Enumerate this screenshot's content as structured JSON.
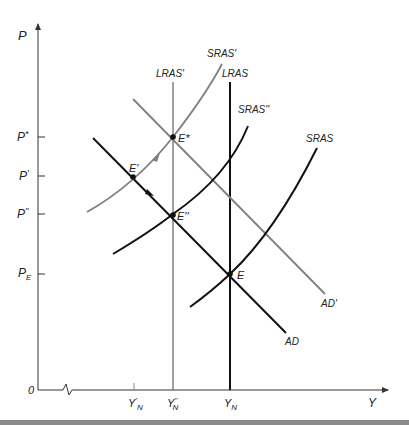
{
  "diagram": {
    "type": "AD-AS macroeconomic model",
    "axes": {
      "y_label": "P",
      "x_label": "Y",
      "origin_label": "0",
      "y_ticks": [
        {
          "label": "P*",
          "y": 137
        },
        {
          "label": "P'",
          "y": 176
        },
        {
          "label": "P''",
          "y": 214
        },
        {
          "label": "P_E",
          "y": 274
        }
      ],
      "x_ticks": [
        {
          "label": "Y'_N",
          "x": 134
        },
        {
          "label": "Y''_N",
          "x": 173
        },
        {
          "label": "Y_N",
          "x": 230
        }
      ]
    },
    "curves": {
      "lras_prime": {
        "label": "LRAS'",
        "color": "#808080"
      },
      "lras": {
        "label": "LRAS",
        "color": "#111111"
      },
      "sras_prime": {
        "label": "SRAS'",
        "color": "#808080"
      },
      "sras_double_prime": {
        "label": "SRAS''",
        "color": "#111111"
      },
      "sras": {
        "label": "SRAS",
        "color": "#111111"
      },
      "ad_prime": {
        "label": "AD'",
        "color": "#808080"
      },
      "ad": {
        "label": "AD",
        "color": "#111111"
      }
    },
    "points": {
      "e_star": {
        "label": "E*"
      },
      "e_prime": {
        "label": "E'"
      },
      "e_double_prime": {
        "label": "E''"
      },
      "e": {
        "label": "E"
      }
    },
    "y_label_parts": {
      "p_star_main": "P",
      "p_star_sup": "*",
      "p_prime_main": "P",
      "p_prime_sup": "'",
      "p_dprime_main": "P",
      "p_dprime_sup": "''",
      "p_e_main": "P",
      "p_e_sub": "E"
    },
    "x_label_parts": {
      "yn_prime_main": "Y",
      "yn_prime_sup": "'",
      "yn_prime_sub": "N",
      "yn_dprime_main": "Y",
      "yn_dprime_sup": "''",
      "yn_dprime_sub": "N",
      "yn_main": "Y",
      "yn_sub": "N"
    }
  }
}
